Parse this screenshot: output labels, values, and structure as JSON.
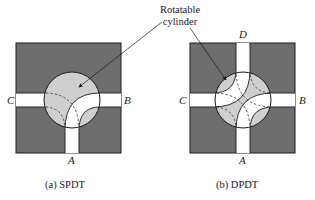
{
  "callout": {
    "line1": "Rotatable",
    "line2": "cylinder"
  },
  "figures": [
    {
      "id": "spdt",
      "caption": "(a)  SPDT",
      "ports": {
        "A": "A",
        "B": "B",
        "C": "C"
      }
    },
    {
      "id": "dpdt",
      "caption": "(b)  DPDT",
      "ports": {
        "A": "A",
        "B": "B",
        "C": "C",
        "D": "D"
      }
    }
  ],
  "colors": {
    "housing": "#6e6e6e",
    "cylinder": "#cfcfcf",
    "channel": "#ffffff",
    "stroke": "#1a1a1a"
  }
}
